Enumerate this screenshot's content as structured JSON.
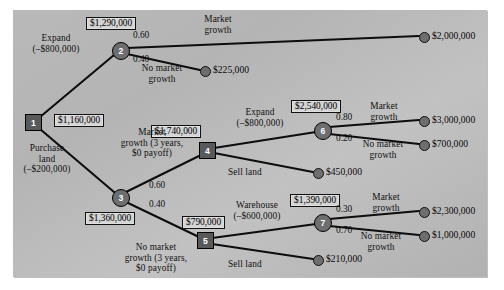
{
  "figure": {
    "background_color": "#b8b8b8",
    "panel_border_color": "#8f8f8f"
  },
  "nodes": [
    {
      "id": "1",
      "label": "1",
      "type": "decision",
      "x": 33,
      "y": 122
    },
    {
      "id": "2",
      "label": "2",
      "type": "chance",
      "x": 120,
      "y": 50
    },
    {
      "id": "3",
      "label": "3",
      "type": "chance",
      "x": 120,
      "y": 197
    },
    {
      "id": "4",
      "label": "4",
      "type": "decision",
      "x": 207,
      "y": 150
    },
    {
      "id": "5",
      "label": "5",
      "type": "decision",
      "x": 205,
      "y": 240
    },
    {
      "id": "6",
      "label": "6",
      "type": "chance",
      "x": 322,
      "y": 130
    },
    {
      "id": "7",
      "label": "7",
      "type": "chance",
      "x": 322,
      "y": 222
    }
  ],
  "value_boxes": [
    {
      "name": "node-2-value",
      "value": "$1,290,000",
      "x": 86,
      "y": 18
    },
    {
      "name": "node-1-value",
      "value": "$1,160,000",
      "x": 54,
      "y": 115
    },
    {
      "name": "node-4-value",
      "value": "$1,740,000",
      "x": 151,
      "y": 126
    },
    {
      "name": "node-6-value",
      "value": "$2,540,000",
      "x": 291,
      "y": 101
    },
    {
      "name": "node-3-value",
      "value": "$1,360,000",
      "x": 85,
      "y": 213
    },
    {
      "name": "node-5-value",
      "value": "$790,000",
      "x": 182,
      "y": 217
    },
    {
      "name": "node-7-value",
      "value": "$1,390,000",
      "x": 290,
      "y": 195
    }
  ],
  "branch_labels": [
    {
      "name": "branch-expand-from-1",
      "text": "Expand\n(–$800,000)",
      "x": 28,
      "y": 36
    },
    {
      "name": "branch-purchase-land-from-1",
      "text": "Purchase\nland\n(–$200,000)",
      "x": 12,
      "y": 148
    },
    {
      "name": "branch-market-growth-from-2",
      "text": "Market\ngrowth",
      "x": 190,
      "y": 16
    },
    {
      "name": "branch-no-market-growth-from-2",
      "text": "No market\ngrowth",
      "x": 132,
      "y": 66
    },
    {
      "name": "branch-market-growth-3yr-from-3",
      "text": "Market\ngrowth (3 years,\n$0 payoff)",
      "x": 124,
      "y": 130
    },
    {
      "name": "branch-no-market-growth-3yr-from-3",
      "text": "No market\ngrowth (3 years,\n$0 payoff)",
      "x": 120,
      "y": 245
    },
    {
      "name": "branch-expand-from-4",
      "text": "Expand\n(–$800,000)",
      "x": 228,
      "y": 110
    },
    {
      "name": "branch-sell-land-from-4",
      "text": "Sell land",
      "x": 233,
      "y": 170
    },
    {
      "name": "branch-warehouse-from-5",
      "text": "Warehouse\n(–$600,000)",
      "x": 226,
      "y": 203
    },
    {
      "name": "branch-sell-land-from-5",
      "text": "Sell land",
      "x": 233,
      "y": 262
    },
    {
      "name": "branch-market-growth-from-6",
      "text": "Market\ngrowth",
      "x": 360,
      "y": 103
    },
    {
      "name": "branch-no-market-growth-from-6",
      "text": "No market\ngrowth",
      "x": 352,
      "y": 141
    },
    {
      "name": "branch-market-growth-from-7",
      "text": "Market\ngrowth",
      "x": 362,
      "y": 194
    },
    {
      "name": "branch-no-market-growth-from-7",
      "text": "No market\ngrowth",
      "x": 350,
      "y": 233
    }
  ],
  "probabilities": [
    {
      "name": "prob-node-2-growth",
      "value": "0.60",
      "x": 133,
      "y": 33
    },
    {
      "name": "prob-node-2-no-growth",
      "value": "0.40",
      "x": 133,
      "y": 55
    },
    {
      "name": "prob-node-3-growth",
      "value": "0.60",
      "x": 149,
      "y": 182
    },
    {
      "name": "prob-node-3-no-growth",
      "value": "0.40",
      "x": 149,
      "y": 200
    },
    {
      "name": "prob-node-6-growth",
      "value": "0.80",
      "x": 336,
      "y": 114
    },
    {
      "name": "prob-node-6-no-growth",
      "value": "0.20",
      "x": 336,
      "y": 134
    },
    {
      "name": "prob-node-7-growth",
      "value": "0.30",
      "x": 336,
      "y": 206
    },
    {
      "name": "prob-node-7-no-growth",
      "value": "0.70",
      "x": 336,
      "y": 226
    }
  ],
  "terminals": [
    {
      "name": "terminal-2000000",
      "payoff": "$2,000,000",
      "x": 423,
      "y": 36,
      "label_x": 432,
      "label_y": 31
    },
    {
      "name": "terminal-225000",
      "payoff": "$225,000",
      "x": 204,
      "y": 70,
      "label_x": 213,
      "label_y": 65
    },
    {
      "name": "terminal-3000000",
      "payoff": "$3,000,000",
      "x": 423,
      "y": 120,
      "label_x": 432,
      "label_y": 115
    },
    {
      "name": "terminal-700000",
      "payoff": "$700,000",
      "x": 423,
      "y": 144,
      "label_x": 432,
      "label_y": 139
    },
    {
      "name": "terminal-450000",
      "payoff": "$450,000",
      "x": 317,
      "y": 172,
      "label_x": 326,
      "label_y": 167
    },
    {
      "name": "terminal-2300000",
      "payoff": "$2,300,000",
      "x": 423,
      "y": 211,
      "label_x": 432,
      "label_y": 206
    },
    {
      "name": "terminal-1000000",
      "payoff": "$1,000,000",
      "x": 423,
      "y": 235,
      "label_x": 432,
      "label_y": 230
    },
    {
      "name": "terminal-210000",
      "payoff": "$210,000",
      "x": 317,
      "y": 259,
      "label_x": 326,
      "label_y": 254
    }
  ],
  "edges": [
    {
      "name": "edge-1-to-2",
      "from": "1",
      "to": "2"
    },
    {
      "name": "edge-1-to-3",
      "from": "1",
      "to": "3"
    },
    {
      "name": "edge-2-to-2000000",
      "from": "2",
      "to": "terminal-2000000"
    },
    {
      "name": "edge-2-to-225000",
      "from": "2",
      "to": "terminal-225000"
    },
    {
      "name": "edge-3-to-4",
      "from": "3",
      "to": "4"
    },
    {
      "name": "edge-3-to-5",
      "from": "3",
      "to": "5"
    },
    {
      "name": "edge-4-to-6",
      "from": "4",
      "to": "6"
    },
    {
      "name": "edge-4-to-450000",
      "from": "4",
      "to": "terminal-450000"
    },
    {
      "name": "edge-6-to-3000000",
      "from": "6",
      "to": "terminal-3000000"
    },
    {
      "name": "edge-6-to-700000",
      "from": "6",
      "to": "terminal-700000"
    },
    {
      "name": "edge-5-to-7",
      "from": "5",
      "to": "7"
    },
    {
      "name": "edge-5-to-210000",
      "from": "5",
      "to": "terminal-210000"
    },
    {
      "name": "edge-7-to-2300000",
      "from": "7",
      "to": "terminal-2300000"
    },
    {
      "name": "edge-7-to-1000000",
      "from": "7",
      "to": "terminal-1000000"
    }
  ]
}
